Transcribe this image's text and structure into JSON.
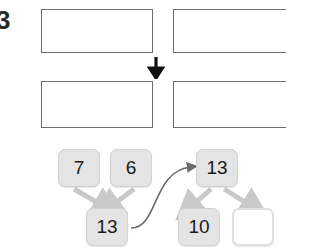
{
  "question_number": "3",
  "icons": {
    "down_arrow": "down-arrow-icon",
    "curved_arrow": "curved-arrow-icon"
  },
  "colors": {
    "gray_dot": "#8c8c8c",
    "black_dot": "#141414",
    "frame_border": "#6e6e6e",
    "shaded_cell": "#e2e2e2",
    "box_fill": "#e4e4e4",
    "box_border": "#d2d2d2",
    "empty_box_fill": "#ffffff",
    "arrow": "#c9c9c9",
    "text": "#1a1a1a"
  },
  "ten_frames": [
    {
      "name": "frame-top-left",
      "shaded": false,
      "count": 7,
      "rows": [
        [
          "gray",
          "gray",
          "gray",
          "gray",
          "gray"
        ],
        [
          "gray",
          "gray",
          "empty",
          "empty",
          "empty"
        ]
      ]
    },
    {
      "name": "frame-top-right",
      "shaded": false,
      "count": 6,
      "rows": [
        [
          "black",
          "black",
          "black",
          "black",
          "black"
        ],
        [
          "black",
          "empty",
          "empty",
          "empty",
          "empty"
        ]
      ]
    },
    {
      "name": "frame-bottom-left",
      "shaded": true,
      "count": 10,
      "rows": [
        [
          "gray",
          "gray",
          "gray",
          "gray",
          "gray"
        ],
        [
          "gray",
          "gray",
          "black",
          "black",
          "black"
        ]
      ]
    },
    {
      "name": "frame-bottom-right",
      "shaded": false,
      "count": 3,
      "rows": [
        [
          "black",
          "black",
          "black",
          "empty",
          "empty"
        ],
        [
          "empty",
          "empty",
          "empty",
          "empty",
          "empty"
        ]
      ]
    }
  ],
  "number_bonds": {
    "left": {
      "addend_1": "7",
      "addend_2": "6",
      "sum": "13"
    },
    "right": {
      "total": "13",
      "part_1": "10",
      "part_2": ""
    }
  }
}
